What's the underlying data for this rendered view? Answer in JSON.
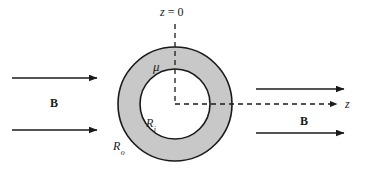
{
  "figure": {
    "background_color": "#ffffff",
    "line_color": "#1a1a1a",
    "shell_fill_color": "#c8c8c8",
    "bore_fill_color": "#ffffff",
    "width": 365,
    "height": 174
  },
  "labels": {
    "z_origin": "z = 0",
    "z_origin_var": "z",
    "z_origin_eq": " = 0",
    "z_axis": "z",
    "permeability": "μ",
    "inner_radius_base": "R",
    "inner_radius_sub": "i",
    "outer_radius_base": "R",
    "outer_radius_sub": "o",
    "field_left": "B",
    "field_right": "B"
  },
  "geometry": {
    "center_x": 175,
    "center_y": 104,
    "outer_radius": 57,
    "inner_radius": 35
  },
  "field_arrows": {
    "left": [
      {
        "name": "left-upper",
        "x1": 12,
        "y1": 78,
        "x2": 97,
        "y2": 78
      },
      {
        "name": "left-lower",
        "x1": 12,
        "y1": 130,
        "x2": 97,
        "y2": 130
      }
    ],
    "right": [
      {
        "name": "right-upper",
        "x1": 256,
        "y1": 89,
        "x2": 344,
        "y2": 89
      },
      {
        "name": "right-lower",
        "x1": 256,
        "y1": 133,
        "x2": 344,
        "y2": 133
      }
    ]
  },
  "axes": {
    "vertical_dashed": {
      "x": 175,
      "y1": 24,
      "y2": 104
    },
    "horizontal_dashed": {
      "y": 104,
      "x1": 175,
      "x2": 341
    }
  }
}
